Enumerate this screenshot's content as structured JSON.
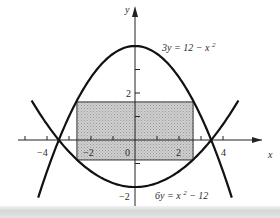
{
  "figure": {
    "mapping": {
      "origin_px": [
        135,
        140
      ],
      "unit_x_px": 22,
      "unit_y_px": 23.5
    },
    "axes": {
      "x_label": "x",
      "y_label": "y",
      "x_ticks": [
        -5,
        -4,
        -3,
        -2,
        -1,
        1,
        2,
        3,
        4
      ],
      "y_ticks": [
        3,
        2,
        1,
        -1,
        -2
      ],
      "x_tick_labels": [
        {
          "value": -4,
          "text": "−4"
        },
        {
          "value": -2,
          "text": "−2"
        },
        {
          "value": 0,
          "text": "0"
        },
        {
          "value": 2,
          "text": "2"
        },
        {
          "value": 4,
          "text": "4"
        }
      ],
      "y_tick_labels": [
        {
          "value": 2,
          "text": "2"
        },
        {
          "value": -2,
          "text": "−2"
        }
      ]
    },
    "curves": [
      {
        "name": "upper-parabola",
        "equation": "3y = 12 − x²",
        "a": -0.3333333,
        "c": 4,
        "x_range": [
          -4.4,
          4.4
        ]
      },
      {
        "name": "lower-parabola",
        "equation": "6y = x² − 12",
        "a": 0.1666667,
        "c": -2,
        "x_range": [
          -4.7,
          4.7
        ]
      }
    ],
    "labels": {
      "upper_curve": "3y = 12 − x²",
      "lower_curve": "6y = x² − 12"
    },
    "rectangle": {
      "x_min": -2.64,
      "x_max": 2.64,
      "y_min": -0.85,
      "y_max": 1.62,
      "fill": "#c8c8c8"
    },
    "colors": {
      "curve": "#111111",
      "axis": "#222222",
      "shade": "#c9c9c9"
    }
  }
}
